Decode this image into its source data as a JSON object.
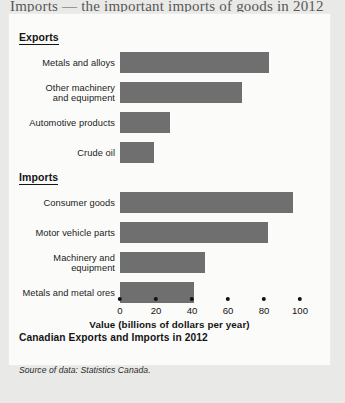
{
  "page": {
    "bleed_text_top": "Imports — the important imports of goods in 2012"
  },
  "figure": {
    "caption": "Canadian Exports and Imports in 2012",
    "source": "Source of data: Statistics Canada.",
    "bar_color": "#6f6f6f",
    "card_background": "#fbfbfa",
    "page_background": "#e9e9e7"
  },
  "chart_data": {
    "type": "bar",
    "orientation": "horizontal",
    "title": "Canadian Exports and Imports in 2012",
    "xlabel": "Value (billions of dollars per year)",
    "ylabel": "",
    "xlim": [
      0,
      100
    ],
    "xticks": [
      0,
      20,
      40,
      60,
      80,
      100
    ],
    "xtick_labels": [
      "0",
      "20",
      "40",
      "60",
      "80",
      "100"
    ],
    "grid": false,
    "legend": false,
    "groups": [
      {
        "name": "Exports",
        "categories": [
          "Metals and alloys",
          "Other machinery and equipment",
          "Automotive products",
          "Crude oil"
        ],
        "values": [
          83,
          68,
          28,
          19
        ]
      },
      {
        "name": "Imports",
        "categories": [
          "Consumer goods",
          "Motor vehicle parts",
          "Machinery and equipment",
          "Metals and metal ores"
        ],
        "values": [
          96,
          82,
          47,
          41
        ]
      }
    ],
    "categories": [
      "Metals and alloys",
      "Other machinery and equipment",
      "Automotive products",
      "Crude oil",
      "Consumer goods",
      "Motor vehicle parts",
      "Machinery and equipment",
      "Metals and metal ores"
    ],
    "values": [
      83,
      68,
      28,
      19,
      96,
      82,
      47,
      41
    ],
    "units": "billions of dollars per year",
    "annotations": [
      "Source of data: Statistics Canada."
    ]
  }
}
